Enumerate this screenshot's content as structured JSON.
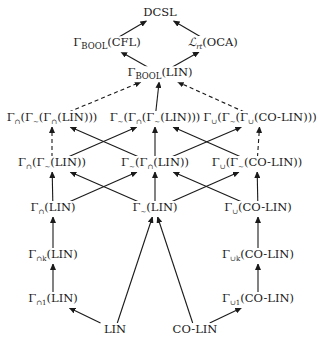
{
  "diagram": {
    "type": "hierarchy",
    "nodes": [
      {
        "id": "dcsl",
        "label": "DCSL",
        "x": 160,
        "y": 13
      },
      {
        "id": "gbool_cfl",
        "label": "Γ_BOOL(CFL)",
        "x": 107,
        "y": 44
      },
      {
        "id": "lrt_oca",
        "label": "ℒ_rt(OCA)",
        "x": 213,
        "y": 44
      },
      {
        "id": "gbool_lin",
        "label": "Γ_BOOL(LIN)",
        "x": 160,
        "y": 74
      },
      {
        "id": "cap_tilde_cap_lin",
        "label": "Γ∩(Γ∼(Γ∩(LIN)))",
        "x": 52,
        "y": 119
      },
      {
        "id": "tilde_cap_tilde_lin",
        "label": "Γ∼(Γ∩(Γ∼(LIN)))",
        "x": 155,
        "y": 119
      },
      {
        "id": "cup_tilde_cup_colin",
        "label": "Γ∪(Γ∼(Γ∪(CO-LIN)))",
        "x": 260,
        "y": 119
      },
      {
        "id": "cap_tilde_lin",
        "label": "Γ∩(Γ∼(LIN))",
        "x": 52,
        "y": 164
      },
      {
        "id": "tilde_cap_lin",
        "label": "Γ∼(Γ∩(LIN))",
        "x": 155,
        "y": 164
      },
      {
        "id": "cup_tilde_colin",
        "label": "Γ∪(Γ∼(CO-LIN))",
        "x": 257,
        "y": 164
      },
      {
        "id": "cap_lin",
        "label": "Γ∩(LIN)",
        "x": 53,
        "y": 209
      },
      {
        "id": "tilde_lin",
        "label": "Γ∼(LIN)",
        "x": 155,
        "y": 209
      },
      {
        "id": "cup_colin",
        "label": "Γ∪(CO-LIN)",
        "x": 258,
        "y": 209
      },
      {
        "id": "capk_lin",
        "label": "Γ∩k(LIN)",
        "x": 53,
        "y": 256
      },
      {
        "id": "cupk_colin",
        "label": "Γ∪k(CO-LIN)",
        "x": 258,
        "y": 256
      },
      {
        "id": "cap1_lin",
        "label": "Γ∩1(LIN)",
        "x": 53,
        "y": 300
      },
      {
        "id": "cup1_colin",
        "label": "Γ∪1(CO-LIN)",
        "x": 258,
        "y": 300
      },
      {
        "id": "lin",
        "label": "LIN",
        "x": 115,
        "y": 330
      },
      {
        "id": "colin",
        "label": "CO-LIN",
        "x": 195,
        "y": 330
      }
    ],
    "edges": [
      {
        "from": "gbool_cfl",
        "to": "dcsl",
        "style": "solid"
      },
      {
        "from": "lrt_oca",
        "to": "dcsl",
        "style": "solid"
      },
      {
        "from": "gbool_lin",
        "to": "gbool_cfl",
        "style": "solid"
      },
      {
        "from": "gbool_lin",
        "to": "lrt_oca",
        "style": "solid"
      },
      {
        "from": "cap_tilde_cap_lin",
        "to": "gbool_lin",
        "style": "dashed"
      },
      {
        "from": "tilde_cap_tilde_lin",
        "to": "gbool_lin",
        "style": "solid"
      },
      {
        "from": "cup_tilde_cup_colin",
        "to": "gbool_lin",
        "style": "dashed"
      },
      {
        "from": "cap_tilde_lin",
        "to": "cap_tilde_cap_lin",
        "style": "dashed"
      },
      {
        "from": "cap_tilde_lin",
        "to": "tilde_cap_tilde_lin",
        "style": "solid"
      },
      {
        "from": "tilde_cap_lin",
        "to": "cap_tilde_cap_lin",
        "style": "solid"
      },
      {
        "from": "tilde_cap_lin",
        "to": "tilde_cap_tilde_lin",
        "style": "solid"
      },
      {
        "from": "tilde_cap_lin",
        "to": "cup_tilde_cup_colin",
        "style": "solid"
      },
      {
        "from": "cup_tilde_colin",
        "to": "tilde_cap_tilde_lin",
        "style": "solid"
      },
      {
        "from": "cup_tilde_colin",
        "to": "cup_tilde_cup_colin",
        "style": "dashed"
      },
      {
        "from": "cap_lin",
        "to": "cap_tilde_lin",
        "style": "solid"
      },
      {
        "from": "cap_lin",
        "to": "tilde_cap_lin",
        "style": "solid"
      },
      {
        "from": "tilde_lin",
        "to": "cap_tilde_lin",
        "style": "solid"
      },
      {
        "from": "tilde_lin",
        "to": "tilde_cap_lin",
        "style": "solid"
      },
      {
        "from": "tilde_lin",
        "to": "cup_tilde_colin",
        "style": "solid"
      },
      {
        "from": "cup_colin",
        "to": "tilde_cap_lin",
        "style": "solid"
      },
      {
        "from": "cup_colin",
        "to": "cup_tilde_colin",
        "style": "solid"
      },
      {
        "from": "capk_lin",
        "to": "cap_lin",
        "style": "solid"
      },
      {
        "from": "cupk_colin",
        "to": "cup_colin",
        "style": "solid"
      },
      {
        "from": "cap1_lin",
        "to": "capk_lin",
        "style": "solid"
      },
      {
        "from": "cup1_colin",
        "to": "cupk_colin",
        "style": "solid"
      },
      {
        "from": "lin",
        "to": "cap1_lin",
        "style": "solid"
      },
      {
        "from": "lin",
        "to": "tilde_lin",
        "style": "solid"
      },
      {
        "from": "colin",
        "to": "tilde_lin",
        "style": "solid"
      },
      {
        "from": "colin",
        "to": "cup1_colin",
        "style": "solid"
      }
    ]
  },
  "labels": {
    "dcsl": "DCSL",
    "gbool_cfl": {
      "gamma": "Γ",
      "sub": "BOOL",
      "arg": "(CFL)"
    },
    "lrt_oca": {
      "script": "ℒ",
      "sub": "rt",
      "arg": "(OCA)"
    },
    "gbool_lin": {
      "gamma": "Γ",
      "sub": "BOOL",
      "arg": "(LIN)"
    },
    "cap_tilde_cap_lin": {
      "pre": "Γ",
      "s1": "∩",
      "m1": "(Γ",
      "s2": "∼",
      "m2": "(Γ",
      "s3": "∩",
      "arg": "(LIN)))"
    },
    "tilde_cap_tilde_lin": {
      "pre": "Γ",
      "s1": "∼",
      "m1": "(Γ",
      "s2": "∩",
      "m2": "(Γ",
      "s3": "∼",
      "arg": "(LIN)))"
    },
    "cup_tilde_cup_colin": {
      "pre": "Γ",
      "s1": "∪",
      "m1": "(Γ",
      "s2": "∼",
      "m2": "(Γ",
      "s3": "∪",
      "arg": "(CO-LIN)))"
    },
    "cap_tilde_lin": {
      "pre": "Γ",
      "s1": "∩",
      "m1": "(Γ",
      "s2": "∼",
      "arg": "(LIN))"
    },
    "tilde_cap_lin": {
      "pre": "Γ",
      "s1": "∼",
      "m1": "(Γ",
      "s2": "∩",
      "arg": "(LIN))"
    },
    "cup_tilde_colin": {
      "pre": "Γ",
      "s1": "∪",
      "m1": "(Γ",
      "s2": "∼",
      "arg": "(CO-LIN))"
    },
    "cap_lin": {
      "pre": "Γ",
      "s1": "∩",
      "arg": "(LIN)"
    },
    "tilde_lin": {
      "pre": "Γ",
      "s1": "∼",
      "arg": "(LIN)"
    },
    "cup_colin": {
      "pre": "Γ",
      "s1": "∪",
      "arg": "(CO-LIN)"
    },
    "capk_lin": {
      "pre": "Γ",
      "s1": "∩k",
      "arg": "(LIN)"
    },
    "cupk_colin": {
      "pre": "Γ",
      "s1": "∪k",
      "arg": "(CO-LIN)"
    },
    "cap1_lin": {
      "pre": "Γ",
      "s1": "∩1",
      "arg": "(LIN)"
    },
    "cup1_colin": {
      "pre": "Γ",
      "s1": "∪1",
      "arg": "(CO-LIN)"
    },
    "lin": "LIN",
    "colin": "CO-LIN"
  },
  "colors": {
    "line": "#1a1a1a",
    "text": "#1a1a1a",
    "background": "#ffffff"
  }
}
